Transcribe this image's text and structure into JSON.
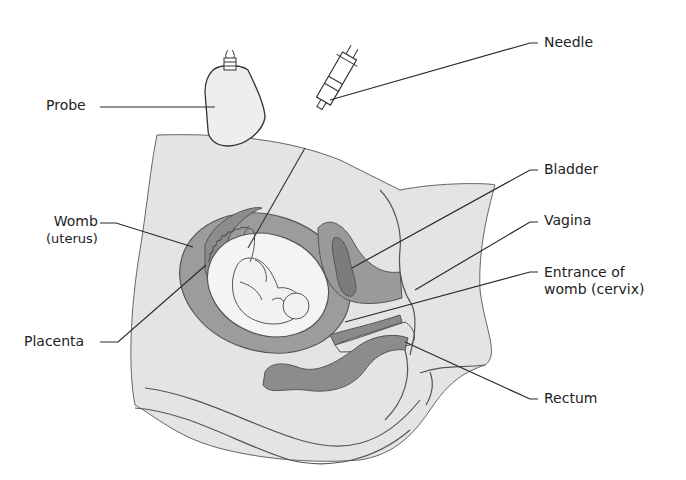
{
  "diagram": {
    "colors": {
      "background": "#ffffff",
      "body_tissue": "#e4e4e4",
      "womb_wall": "#9c9c9c",
      "placenta": "#8c8c8c",
      "amniotic_sac": "#f4f4f4",
      "organ_dark": "#8a8a8a",
      "organ_mid": "#b2b2b2",
      "outline": "#555555",
      "leader_line": "#2a2a2a",
      "label_text": "#222222"
    },
    "labels": {
      "probe": "Probe",
      "needle": "Needle",
      "bladder": "Bladder",
      "womb_line1": "Womb",
      "womb_line2": "(uterus)",
      "vagina": "Vagina",
      "cervix_line1": "Entrance of",
      "cervix_line2": "womb (cervix)",
      "placenta": "Placenta",
      "rectum": "Rectum"
    }
  }
}
